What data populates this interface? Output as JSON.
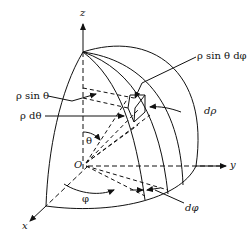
{
  "figure": {
    "type": "spherical-coordinates-volume-element",
    "axes": {
      "z": "z",
      "y": "y",
      "x": "x"
    },
    "origin": "O",
    "angles": {
      "theta": "θ",
      "phi": "φ"
    },
    "labels": {
      "rho_sin_theta": "ρ sin θ",
      "rho_dtheta": "ρ dθ",
      "rho_sin_theta_dphi": "ρ sin θ dφ",
      "drho": "dρ",
      "dphi": "dφ"
    },
    "colors": {
      "stroke": "#111111",
      "background": "#ffffff"
    }
  }
}
